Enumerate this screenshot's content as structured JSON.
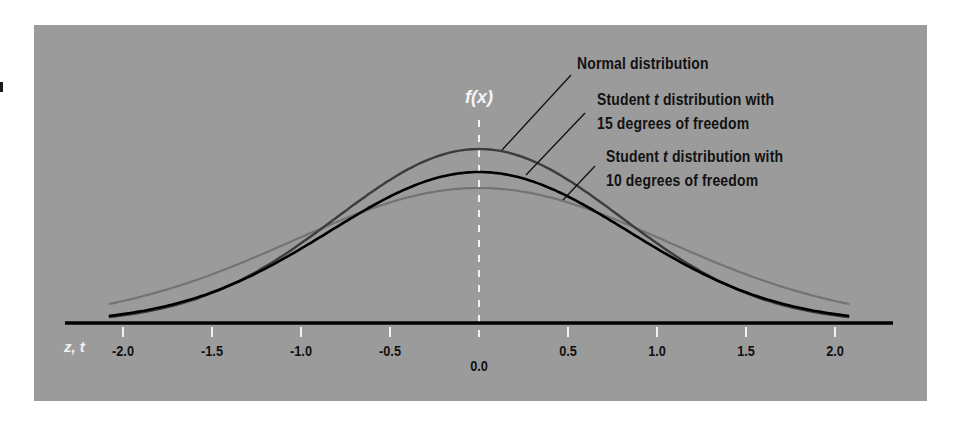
{
  "chart_data": {
    "type": "line",
    "title": "",
    "xlabel": "z, t",
    "ylabel": "f(x)",
    "xlim": [
      -2.1,
      2.1
    ],
    "x_ticks": [
      "-2.0",
      "-1.5",
      "-1.0",
      "-0.5",
      "0.0",
      "0.5",
      "1.0",
      "1.5",
      "2.0"
    ],
    "grid": false,
    "legend_position": "annotations upper right",
    "series": [
      {
        "name": "Normal distribution",
        "color": "#3a3a3a",
        "x": [
          -2.0,
          -1.5,
          -1.0,
          -0.5,
          0.0,
          0.5,
          1.0,
          1.5,
          2.0
        ],
        "values": [
          0.054,
          0.13,
          0.242,
          0.352,
          0.399,
          0.352,
          0.242,
          0.13,
          0.054
        ]
      },
      {
        "name": "Student t distribution with 15 degrees of freedom",
        "color": "#000000",
        "x": [
          -2.0,
          -1.5,
          -1.0,
          -0.5,
          0.0,
          0.5,
          1.0,
          1.5,
          2.0
        ],
        "values": [
          0.06,
          0.129,
          0.236,
          0.345,
          0.392,
          0.345,
          0.236,
          0.129,
          0.06
        ]
      },
      {
        "name": "Student t distribution with 10 degrees of freedom",
        "color": "#6e6e6e",
        "x": [
          -2.0,
          -1.5,
          -1.0,
          -0.5,
          0.0,
          0.5,
          1.0,
          1.5,
          2.0
        ],
        "values": [
          0.061,
          0.127,
          0.23,
          0.34,
          0.389,
          0.34,
          0.23,
          0.127,
          0.061
        ]
      }
    ],
    "annotations": [
      "Normal distribution",
      "Student t distribution with 15 degrees of freedom",
      "Student t distribution with 10 degrees of freedom"
    ]
  },
  "labels": {
    "fx": "f(x)",
    "axis_name": "z, t",
    "normal": "Normal distribution",
    "t15_line1_pre": "Student ",
    "t15_line1_t": "t",
    "t15_line1_post": " distribution with",
    "t15_line2": "15 degrees of freedom",
    "t10_line1_pre": "Student ",
    "t10_line1_t": "t",
    "t10_line1_post": " distribution with",
    "t10_line2": "10 degrees of freedom"
  },
  "ticks": [
    {
      "label": "-2.0",
      "z": -2.0
    },
    {
      "label": "-1.5",
      "z": -1.5
    },
    {
      "label": "-1.0",
      "z": -1.0
    },
    {
      "label": "-0.5",
      "z": -0.5
    },
    {
      "label": "0.0",
      "z": 0.0
    },
    {
      "label": "0.5",
      "z": 0.5
    },
    {
      "label": "1.0",
      "z": 1.0
    },
    {
      "label": "1.5",
      "z": 1.5
    },
    {
      "label": "2.0",
      "z": 2.0
    }
  ],
  "colors": {
    "panel": "#9b9b9b",
    "axis": "#000000",
    "tick": "#f2f2f2"
  }
}
